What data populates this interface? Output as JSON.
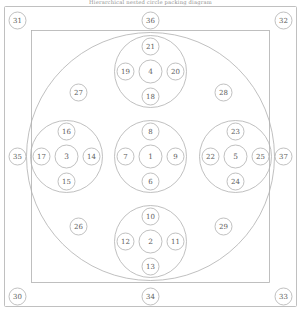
{
  "figure": {
    "title": "Hierarchical nested circle packing diagram",
    "stroke_color": "#b0b0b0",
    "label_color": "#5c5c5c",
    "background": "#ffffff"
  },
  "frame": {
    "outer_border_name": "outer-frame",
    "inner_square_name": "inner-square",
    "big_circle_name": "enclosing-circle"
  },
  "nodes": {
    "corners": [
      {
        "id": "31",
        "position": "top-left"
      },
      {
        "id": "32",
        "position": "top-right"
      },
      {
        "id": "30",
        "position": "bottom-left"
      },
      {
        "id": "33",
        "position": "bottom-right"
      }
    ],
    "edges": [
      {
        "id": "36",
        "position": "top-center"
      },
      {
        "id": "34",
        "position": "bottom-center"
      },
      {
        "id": "35",
        "position": "left-center"
      },
      {
        "id": "37",
        "position": "right-center"
      }
    ],
    "diagonals": [
      {
        "id": "27",
        "position": "upper-left"
      },
      {
        "id": "28",
        "position": "upper-right"
      },
      {
        "id": "26",
        "position": "lower-left"
      },
      {
        "id": "29",
        "position": "lower-right"
      }
    ],
    "clusters": [
      {
        "name": "center-cluster",
        "center": "1",
        "top": "8",
        "left": "7",
        "right": "9",
        "bottom": "6"
      },
      {
        "name": "top-cluster",
        "center": "4",
        "top": "21",
        "left": "19",
        "right": "20",
        "bottom": "18"
      },
      {
        "name": "left-cluster",
        "center": "3",
        "top": "16",
        "left": "17",
        "right": "14",
        "bottom": "15"
      },
      {
        "name": "right-cluster",
        "center": "5",
        "top": "23",
        "left": "22",
        "right": "25",
        "bottom": "24"
      },
      {
        "name": "bottom-cluster",
        "center": "2",
        "top": "10",
        "left": "12",
        "right": "11",
        "bottom": "13"
      }
    ]
  }
}
